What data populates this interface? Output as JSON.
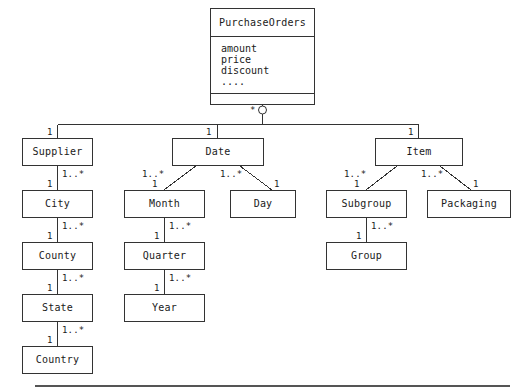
{
  "diagram": {
    "type": "uml-class-diagram",
    "title_class": {
      "name": "PurchaseOrders",
      "attributes": [
        "amount",
        "price",
        "discount",
        "...."
      ],
      "operations": []
    },
    "root_multiplicity": "*",
    "aggregation_marker": "open-circle",
    "nodes": {
      "supplier": "Supplier",
      "city": "City",
      "county": "County",
      "state": "State",
      "country": "Country",
      "date": "Date",
      "month": "Month",
      "day": "Day",
      "quarter": "Quarter",
      "year": "Year",
      "item": "Item",
      "subgroup": "Subgroup",
      "packaging": "Packaging",
      "group": "Group"
    },
    "multiplicities": {
      "one": "1",
      "one_to_many": "1..*",
      "many": "*"
    },
    "edges": [
      {
        "from": "PurchaseOrders",
        "to": "Supplier",
        "target_mult": "1"
      },
      {
        "from": "PurchaseOrders",
        "to": "Date",
        "target_mult": "1"
      },
      {
        "from": "PurchaseOrders",
        "to": "Item",
        "target_mult": "1"
      },
      {
        "from": "Supplier",
        "to": "City",
        "source_mult": "1..*",
        "target_mult": "1"
      },
      {
        "from": "City",
        "to": "County",
        "source_mult": "1..*",
        "target_mult": "1"
      },
      {
        "from": "County",
        "to": "State",
        "source_mult": "1..*",
        "target_mult": "1"
      },
      {
        "from": "State",
        "to": "Country",
        "source_mult": "1..*",
        "target_mult": "1"
      },
      {
        "from": "Date",
        "to": "Month",
        "source_mult": "1..*",
        "target_mult": "1"
      },
      {
        "from": "Date",
        "to": "Day",
        "source_mult": "1..*",
        "target_mult": "1"
      },
      {
        "from": "Month",
        "to": "Quarter",
        "source_mult": "1..*",
        "target_mult": "1"
      },
      {
        "from": "Quarter",
        "to": "Year",
        "source_mult": "1..*",
        "target_mult": "1"
      },
      {
        "from": "Item",
        "to": "Subgroup",
        "source_mult": "1..*",
        "target_mult": "1"
      },
      {
        "from": "Item",
        "to": "Packaging",
        "source_mult": "1..*",
        "target_mult": "1"
      },
      {
        "from": "Subgroup",
        "to": "Group",
        "source_mult": "1..*",
        "target_mult": "1"
      }
    ],
    "colors": {
      "stroke": "#333333",
      "text": "#1a1a1a",
      "background": "#ffffff",
      "rule": "#555555"
    }
  }
}
